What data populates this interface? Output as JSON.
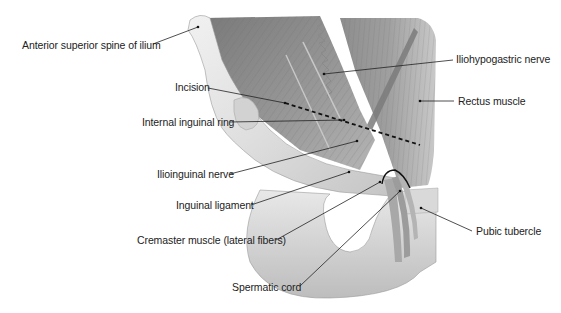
{
  "figure": {
    "labels": [
      {
        "id": "anterior-superior-spine",
        "text": "Anterior superior spine of ilium",
        "x": 22,
        "y": 39,
        "line": [
          153,
          44,
          198,
          27
        ]
      },
      {
        "id": "iliohypogastric-nerve",
        "text": "Iliohypogastric nerve",
        "x": 456,
        "y": 53,
        "line": [
          453,
          60,
          324,
          74
        ]
      },
      {
        "id": "incision",
        "text": "Incision",
        "x": 175,
        "y": 81,
        "line": [
          208,
          88,
          285,
          103
        ]
      },
      {
        "id": "rectus-muscle",
        "text": "Rectus muscle",
        "x": 458,
        "y": 95,
        "line": [
          454,
          101,
          420,
          101
        ]
      },
      {
        "id": "internal-inguinal-ring",
        "text": "Internal inguinal ring",
        "x": 142,
        "y": 116,
        "line": [
          230,
          122,
          344,
          120
        ]
      },
      {
        "id": "ilioinguinal-nerve",
        "text": "Ilioinguinal nerve",
        "x": 157,
        "y": 168,
        "line": [
          230,
          174,
          357,
          141
        ]
      },
      {
        "id": "inguinal-ligament",
        "text": "Inguinal ligament",
        "x": 176,
        "y": 199,
        "line": [
          251,
          205,
          349,
          172
        ]
      },
      {
        "id": "cremaster-muscle",
        "text": "Cremaster muscle (lateral fibers)",
        "x": 137,
        "y": 234,
        "line": [
          276,
          240,
          380,
          182
        ]
      },
      {
        "id": "spermatic-cord",
        "text": "Spermatic cord",
        "x": 232,
        "y": 281,
        "line": [
          300,
          286,
          400,
          191
        ]
      },
      {
        "id": "pubic-tubercle",
        "text": "Pubic tubercle",
        "x": 476,
        "y": 225,
        "line": [
          472,
          231,
          421,
          208
        ]
      }
    ]
  }
}
